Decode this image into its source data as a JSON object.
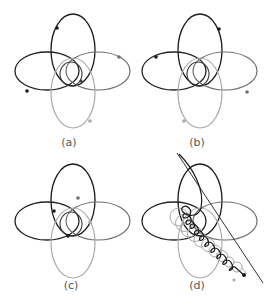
{
  "figure": {
    "colors": {
      "black": "#1a1a1a",
      "dark": "#3a3a3a",
      "gray": "#6e6e6e",
      "light": "#a8a8a8",
      "label": "#555555"
    },
    "panels": [
      {
        "id": "a",
        "label": "(a)"
      },
      {
        "id": "b",
        "label": "(b)"
      },
      {
        "id": "c",
        "label": "(c)"
      },
      {
        "id": "d",
        "label": "(d)"
      }
    ]
  }
}
